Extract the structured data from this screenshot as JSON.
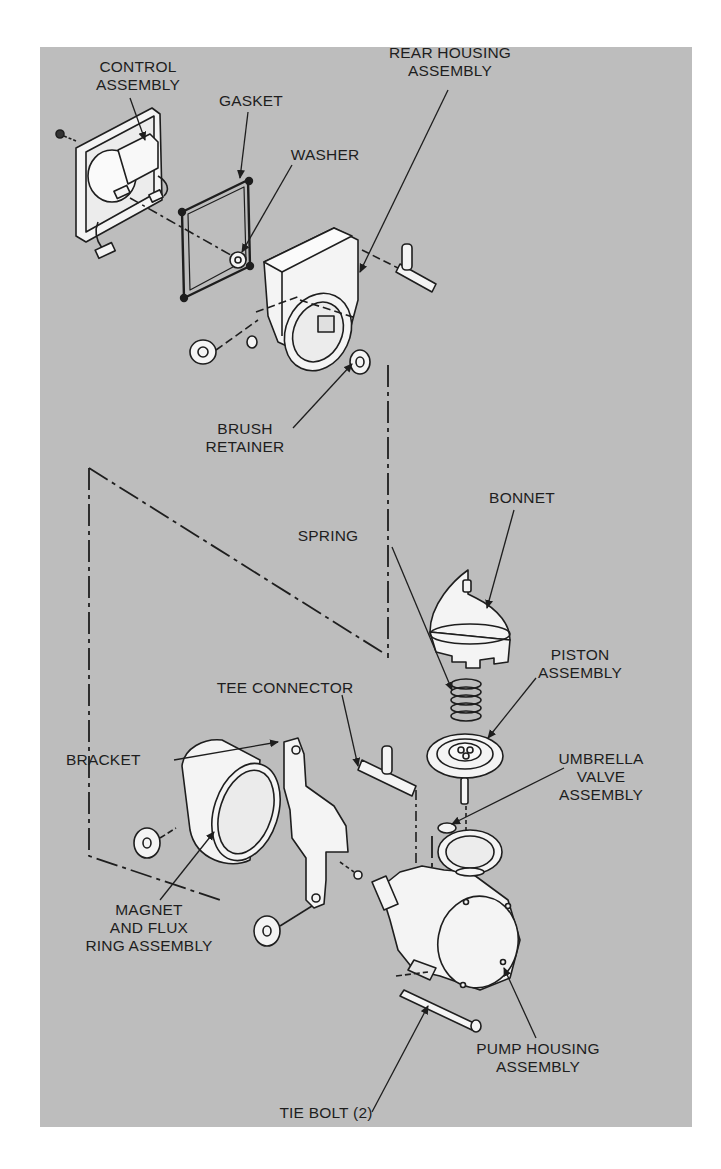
{
  "diagram": {
    "type": "exploded-parts-view",
    "colors": {
      "background": "#bdbdbd",
      "page": "#ffffff",
      "ink": "#1e1e1e",
      "part_fill": "#f4f4f4"
    },
    "labels": {
      "control_assembly": "CONTROL\nASSEMBLY",
      "gasket": "GASKET",
      "washer": "WASHER",
      "rear_housing_assembly": "REAR HOUSING\nASSEMBLY",
      "brush_retainer": "BRUSH\nRETAINER",
      "bonnet": "BONNET",
      "spring": "SPRING",
      "piston_assembly": "PISTON\nASSEMBLY",
      "tee_connector": "TEE CONNECTOR",
      "bracket": "BRACKET",
      "umbrella_valve_assembly": "UMBRELLA\nVALVE\nASSEMBLY",
      "magnet_and_flux_ring_assembly": "MAGNET\nAND FLUX\nRING ASSEMBLY",
      "pump_housing_assembly": "PUMP HOUSING\nASSEMBLY",
      "tie_bolt": "TIE BOLT (2)"
    }
  }
}
